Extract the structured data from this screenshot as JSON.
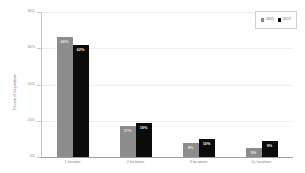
{
  "chart_data": {
    "type": "bar",
    "title": "",
    "subtitle": "",
    "xlabel": "",
    "ylabel": "Percent of respondents",
    "ylim": [
      0,
      80
    ],
    "y_ticks": [
      "0%",
      "20%",
      "40%",
      "60%",
      "80%"
    ],
    "y_tick_values": [
      0,
      20,
      40,
      60,
      80
    ],
    "grid": "horizontal-faint",
    "legend_position": "top-right",
    "categories": [
      "1 location",
      "2 locations",
      "3 locations",
      "4+ locations"
    ],
    "series": [
      {
        "name": "2015",
        "color": "#8c8c8c",
        "values": [
          66,
          17,
          8,
          5
        ],
        "labels": [
          "66%",
          "17%",
          "8%",
          "5%"
        ]
      },
      {
        "name": "2017",
        "color": "#0b0b0b",
        "values": [
          62,
          19,
          10,
          9
        ],
        "labels": [
          "62%",
          "19%",
          "10%",
          "9%"
        ]
      }
    ]
  },
  "axis": {
    "y_title": "Percent of respondents"
  },
  "legend": {
    "items": [
      {
        "label": "2015",
        "color": "#8c8c8c"
      },
      {
        "label": "2017",
        "color": "#0b0b0b"
      }
    ]
  }
}
